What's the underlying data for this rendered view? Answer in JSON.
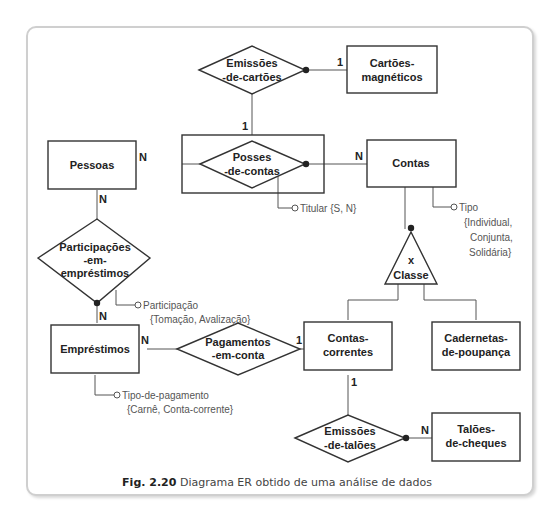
{
  "caption": {
    "fig": "Fig. 2.20",
    "text": "Diagrama ER obtido de uma análise de dados"
  },
  "entities": {
    "cartoes": [
      "Cartões-",
      "magnéticos"
    ],
    "pessoas": [
      "Pessoas"
    ],
    "contas": [
      "Contas"
    ],
    "emprestimos": [
      "Empréstimos"
    ],
    "contas_correntes": [
      "Contas-",
      "correntes"
    ],
    "cadernetas": [
      "Cadernetas-",
      "de-poupança"
    ],
    "taloes": [
      "Talões-",
      "de-cheques"
    ]
  },
  "relationships": {
    "emissoes_cartoes": [
      "Emissões",
      "-de-cartões"
    ],
    "posses_contas": [
      "Posses",
      "-de-contas"
    ],
    "participacoes": [
      "Participações",
      "-em-",
      "empréstimos"
    ],
    "pagamentos": [
      "Pagamentos",
      "-em-conta"
    ],
    "emissoes_taloes": [
      "Emissões",
      "-de-talões"
    ]
  },
  "generalization": {
    "symbol": "x",
    "label": "Classe"
  },
  "cardinalities": {
    "cartoes_1": "1",
    "posses_1": "1",
    "pessoas_posses_N": "N",
    "contas_N": "N",
    "pessoas_part_N": "N",
    "emprestimos_part_N": "N",
    "emprestimos_pag_N": "N",
    "cc_pag_1": "1",
    "cc_taloes_1": "1",
    "taloes_N": "N"
  },
  "attributes": {
    "titular": [
      "Titular {S, N}"
    ],
    "tipo": [
      "Tipo",
      "{Individual,",
      "Conjunta,",
      "Solidária}"
    ],
    "participacao": [
      "Participação",
      "{Tomação, Avalização}"
    ],
    "tipo_pagamento": [
      "Tipo-de-pagamento",
      "{Carnê, Conta-corrente}"
    ]
  }
}
